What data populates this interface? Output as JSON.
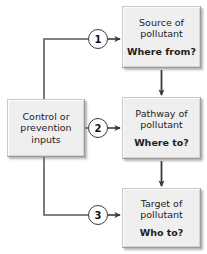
{
  "diagram": {
    "type": "flow-diagram",
    "background_color": "#ffffff",
    "node_fill_color": "#efefef",
    "node_border_color": "#9a9a9a",
    "line_color": "#4a4a4a",
    "marker_fill_color": "#ffffff",
    "marker_border_color": "#3b3b3b"
  },
  "nodes": {
    "control": {
      "line1": "Control or",
      "line2": "prevention",
      "line3": "inputs"
    },
    "source": {
      "line1": "Source of",
      "line2": "pollutant",
      "question": "Where from?"
    },
    "pathway": {
      "line1": "Pathway of",
      "line2": "pollutant",
      "question": "Where to?"
    },
    "target": {
      "line1": "Target of",
      "line2": "pollutant",
      "question": "Who to?"
    }
  },
  "markers": {
    "one": "1",
    "two": "2",
    "three": "3"
  },
  "edges": [
    {
      "id": "control-to-source",
      "from": "control",
      "to": "source",
      "marker": "1"
    },
    {
      "id": "control-to-pathway",
      "from": "control",
      "to": "pathway",
      "marker": "2"
    },
    {
      "id": "control-to-target",
      "from": "control",
      "to": "target",
      "marker": "3"
    },
    {
      "id": "source-to-pathway",
      "from": "source",
      "to": "pathway",
      "marker": ""
    },
    {
      "id": "pathway-to-target",
      "from": "pathway",
      "to": "target",
      "marker": ""
    }
  ]
}
